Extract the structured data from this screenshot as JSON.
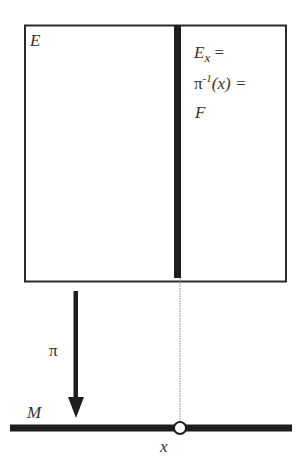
{
  "diagram": {
    "type": "fiber-bundle",
    "labels": {
      "total_space": "E",
      "fiber_line1_main": "E",
      "fiber_line1_sub": "x",
      "fiber_line1_eq": " =",
      "fiber_line2_pi": "π",
      "fiber_line2_sup": "-1",
      "fiber_line2_arg": "(x) =",
      "fiber_line3": "F",
      "projection": "π",
      "base_space": "M",
      "point": "x"
    },
    "colors": {
      "stroke": "#2a2a2a",
      "fiber": "#1e1e1e",
      "dotted": "#888888",
      "background": "#ffffff"
    }
  }
}
